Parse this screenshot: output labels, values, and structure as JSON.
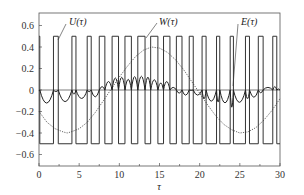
{
  "chart_data": {
    "type": "line",
    "title": "",
    "xlabel": "τ",
    "ylabel": "",
    "xlim": [
      0,
      30
    ],
    "ylim": [
      -0.7,
      0.7
    ],
    "grid": false,
    "legend": "inline annotations with pointer lines",
    "x_ticks": [
      0,
      5,
      10,
      15,
      20,
      25,
      30
    ],
    "x_tick_labels": [
      "0",
      "5",
      "10",
      "15",
      "20",
      "25",
      "30"
    ],
    "y_ticks": [
      0.6,
      0.4,
      0.2,
      0,
      -0.2,
      -0.4,
      -0.6
    ],
    "y_tick_labels": [
      "0.6",
      "0.4",
      "0.2",
      "0",
      "−0.2",
      "−0.4",
      "−0.6"
    ],
    "series": [
      {
        "name": "U(τ)",
        "label": "U(τ)",
        "style": "solid square wave (PWM), levels ±0.5",
        "levels": [
          0.5,
          -0.5
        ],
        "high_intervals": [
          [
            0.0,
            0.1
          ],
          [
            1.8,
            2.4
          ],
          [
            4.1,
            4.6
          ],
          [
            6.0,
            6.5
          ],
          [
            7.5,
            8.2
          ],
          [
            9.1,
            9.9
          ],
          [
            10.7,
            11.5
          ],
          [
            12.3,
            13.2
          ],
          [
            13.9,
            14.8
          ],
          [
            15.5,
            16.3
          ],
          [
            17.1,
            17.8
          ],
          [
            18.7,
            19.2
          ],
          [
            20.3,
            20.8
          ],
          [
            22.1,
            22.5
          ],
          [
            23.8,
            24.2
          ],
          [
            25.7,
            26.2
          ],
          [
            27.3,
            27.9
          ],
          [
            29.1,
            29.6
          ]
        ]
      },
      {
        "name": "W(τ)",
        "label": "W(τ)",
        "style": "dotted sinusoid",
        "x": [
          0,
          1,
          2,
          3,
          3.5,
          4,
          5,
          6,
          7,
          8,
          9,
          10,
          11,
          12,
          13,
          14,
          15,
          16,
          17,
          18,
          19,
          20,
          21,
          22,
          23,
          24,
          25,
          26,
          27,
          28,
          29,
          30
        ],
        "values": [
          -0.2,
          -0.3,
          -0.36,
          -0.39,
          -0.4,
          -0.39,
          -0.36,
          -0.3,
          -0.21,
          -0.1,
          0.01,
          0.12,
          0.22,
          0.31,
          0.37,
          0.4,
          0.39,
          0.35,
          0.28,
          0.19,
          0.08,
          -0.03,
          -0.14,
          -0.24,
          -0.32,
          -0.37,
          -0.4,
          -0.39,
          -0.35,
          -0.28,
          -0.19,
          -0.08
        ]
      },
      {
        "name": "E(τ)",
        "label": "E(τ)",
        "style": "solid ripple (error signal), arcs between switching instants",
        "x": [
          0,
          1,
          2,
          3,
          4,
          5,
          6,
          7,
          8,
          9,
          10,
          11,
          12,
          13,
          14,
          15,
          16,
          17,
          18,
          19,
          20,
          21,
          22,
          23,
          24,
          25,
          26,
          27,
          28,
          29,
          30
        ],
        "values": [
          0.0,
          -0.08,
          0.0,
          -0.09,
          0.0,
          -0.07,
          0.0,
          -0.04,
          0.03,
          0.06,
          0.08,
          0.06,
          0.08,
          0.08,
          0.07,
          0.04,
          0.05,
          0.0,
          -0.04,
          0.0,
          -0.04,
          -0.06,
          -0.07,
          -0.07,
          -0.1,
          -0.07,
          -0.05,
          -0.04,
          0.0,
          0.03,
          0.0
        ]
      }
    ],
    "annotations": [
      {
        "text": "U(τ)",
        "points_to": "U(τ) pulse near τ≈2"
      },
      {
        "text": "W(τ)",
        "points_to": "W(τ) curve near τ≈14"
      },
      {
        "text": "E(τ)",
        "points_to": "E(τ) ripple near τ≈24"
      }
    ],
    "reference_line": {
      "y": 0,
      "style": "thin horizontal zero line"
    }
  }
}
